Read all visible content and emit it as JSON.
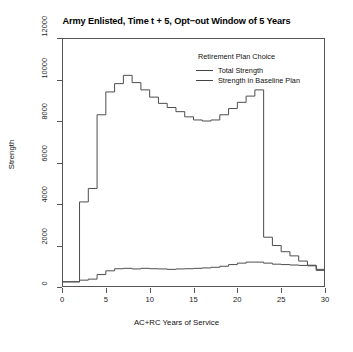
{
  "chart_data": {
    "type": "line",
    "title": "Army Enlisted, Time t + 5, Opt−out Window of 5 Years",
    "xlabel": "AC+RC Years of Service",
    "ylabel": "Strength",
    "xlim": [
      0,
      30
    ],
    "ylim": [
      0,
      12000
    ],
    "xticks": [
      0,
      5,
      10,
      15,
      20,
      25,
      30
    ],
    "yticks": [
      0,
      2000,
      4000,
      6000,
      8000,
      10000,
      12000
    ],
    "grid": false,
    "step_style": "post",
    "legend": {
      "title": "Retirement Plan Choice",
      "position": "top-right-inside",
      "entries": [
        "Total Strength",
        "Strength in Baseline Plan"
      ]
    },
    "x": [
      0,
      1,
      2,
      3,
      4,
      5,
      6,
      7,
      8,
      9,
      10,
      11,
      12,
      13,
      14,
      15,
      16,
      17,
      18,
      19,
      20,
      21,
      22,
      23,
      24,
      25,
      26,
      27,
      28,
      29
    ],
    "series": [
      {
        "name": "Total Strength",
        "color": "#4d4d4d",
        "values": [
          250,
          250,
          4100,
          4750,
          8300,
          9400,
          9800,
          10200,
          9850,
          9500,
          9150,
          8850,
          8650,
          8450,
          8200,
          8050,
          8000,
          8050,
          8300,
          8600,
          8900,
          9200,
          9500,
          2400,
          2000,
          1700,
          1500,
          1250,
          1050,
          850
        ]
      },
      {
        "name": "Strength in Baseline Plan",
        "color": "#4d4d4d",
        "values": [
          250,
          250,
          330,
          380,
          600,
          780,
          880,
          900,
          870,
          900,
          880,
          870,
          850,
          870,
          880,
          900,
          920,
          950,
          1000,
          1080,
          1150,
          1200,
          1200,
          1150,
          1100,
          1080,
          1060,
          1040,
          1020,
          800
        ]
      }
    ]
  }
}
